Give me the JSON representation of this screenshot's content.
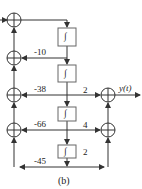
{
  "diagram": {
    "caption": "(b)",
    "output_label": "y(t)",
    "integrator_symbol": "∫",
    "feedback_gains": [
      "-10",
      "-38",
      "-66",
      "-45"
    ],
    "output_gains": [
      "2",
      "4",
      "2"
    ],
    "integrators": 4,
    "summing_junctions": 6,
    "colors": {
      "line": "#333333",
      "box": "#666666"
    }
  }
}
